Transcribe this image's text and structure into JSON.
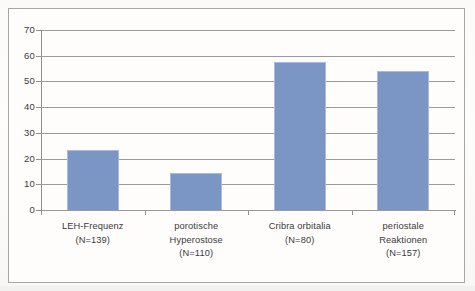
{
  "chart_data": {
    "type": "bar",
    "title": "",
    "subtitle": "",
    "xlabel": "",
    "ylabel": "",
    "ylim": [
      0,
      70
    ],
    "ytick_step": 10,
    "ytick_labels": [
      "70",
      "60",
      "50",
      "40",
      "30",
      "20",
      "10",
      "0"
    ],
    "ytick_values": [
      70,
      60,
      50,
      40,
      30,
      20,
      10,
      0
    ],
    "grid": true,
    "legend": false,
    "legend_position": "none",
    "categories": [
      "LEH-Frequenz\n(N=139)",
      "porotische Hyperostose\n(N=110)",
      "Cribra orbitalia\n(N=80)",
      "periostale Reaktionen\n(N=157)"
    ],
    "category_lines": [
      [
        "LEH-Frequenz",
        "(N=139)"
      ],
      [
        "porotische",
        "Hyperostose",
        "(N=110)"
      ],
      [
        "Cribra orbitalia",
        "(N=80)"
      ],
      [
        "periostale",
        "Reaktionen",
        "(N=157)"
      ]
    ],
    "sample_sizes": [
      139,
      110,
      80,
      157
    ],
    "values": [
      23.5,
      14.5,
      57.5,
      54
    ],
    "bar_color": "#7b95c4",
    "bar_edge_color": "#a8bbdc",
    "grid_color": "#9a9a9a",
    "axis_color": "#8f8f8f",
    "plot_background": "#fefdfc",
    "frame_color": "#a6a6a6"
  }
}
